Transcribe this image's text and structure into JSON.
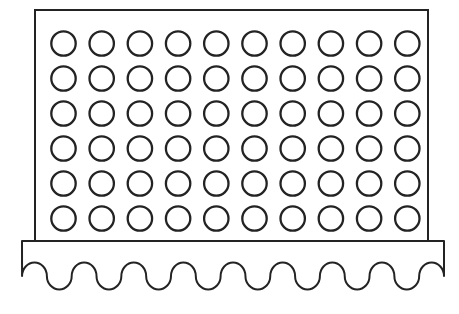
{
  "figure": {
    "canvas": {
      "width": 459,
      "height": 314
    },
    "colors": {
      "background": "#ffffff",
      "line": "#232323"
    },
    "panel": {
      "x": 35,
      "y": 10,
      "width": 393,
      "height": 231,
      "stroke_width": 2
    },
    "hole_grid": {
      "rows": 6,
      "columns": 10,
      "total_holes": 60,
      "first_center_x": 63.5,
      "first_center_y": 43.5,
      "spacing_x": 38.2,
      "spacing_y": 35,
      "radius": 12.2,
      "stroke_width": 2.3
    },
    "base": {
      "left": 22,
      "right": 444,
      "top": 241,
      "wave_baseline": 276,
      "wave_half_arcs": 17,
      "crest_count": 8,
      "valley_count": 9,
      "wave_amplitude": 13.5,
      "stroke_width": 2
    }
  }
}
